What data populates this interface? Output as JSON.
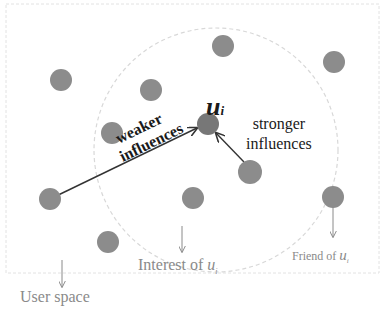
{
  "diagram": {
    "center_node_label": "u",
    "center_node_subscript": "i",
    "weaker_label_line1": "weaker",
    "weaker_label_line2": "influences",
    "stronger_label_line1": "stronger",
    "stronger_label_line2": "influences",
    "interest_label_prefix": "Interest of ",
    "interest_label_var": "u",
    "interest_label_sub": "i",
    "friend_label_prefix": "Friend of ",
    "friend_label_var": "u",
    "friend_label_sub": "i",
    "user_space_label": "User space",
    "colors": {
      "node": "#8c8c8c",
      "center_node": "#777777",
      "arrow": "#333333",
      "annotation": "#8a8a8a",
      "circle_dash": "#d8d8d8",
      "box_border": "#e2e2e2"
    },
    "nodes": [
      {
        "id": "n1",
        "x": 61,
        "y": 80
      },
      {
        "id": "n2",
        "x": 151,
        "y": 90
      },
      {
        "id": "n3",
        "x": 223,
        "y": 46
      },
      {
        "id": "n4",
        "x": 334,
        "y": 62
      },
      {
        "id": "n5",
        "x": 112,
        "y": 133
      },
      {
        "id": "ui",
        "x": 208,
        "y": 124
      },
      {
        "id": "n6",
        "x": 250,
        "y": 172
      },
      {
        "id": "n7",
        "x": 50,
        "y": 199
      },
      {
        "id": "n8",
        "x": 193,
        "y": 198
      },
      {
        "id": "n9",
        "x": 333,
        "y": 197
      },
      {
        "id": "n10",
        "x": 108,
        "y": 242
      }
    ]
  }
}
